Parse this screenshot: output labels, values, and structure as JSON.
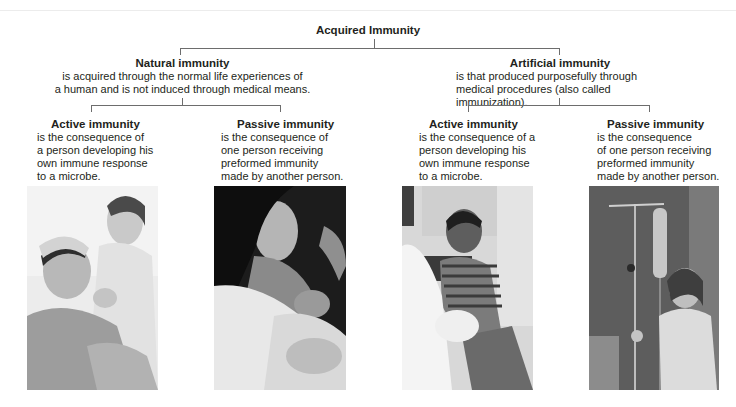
{
  "title": "Acquired Immunity",
  "branches": [
    {
      "heading": "Natural immunity",
      "description_lines": [
        "is acquired through the normal life experiences of",
        "a human and is not induced through medical means."
      ],
      "children": [
        {
          "heading": "Active immunity",
          "description_lines": [
            "is the consequence of",
            "a person developing his",
            "own immune response",
            "to a microbe."
          ],
          "photo": "child-with-fever-caregiver-photo"
        },
        {
          "heading": "Passive immunity",
          "description_lines": [
            "is the consequence of",
            "one person receiving",
            "preformed immunity",
            "made by another person."
          ],
          "photo": "mother-breastfeeding-infant-photo"
        }
      ]
    },
    {
      "heading": "Artificial immunity",
      "description_lines": [
        "is that produced purposefully through",
        "medical procedures (also called immunization)."
      ],
      "children": [
        {
          "heading": "Active immunity",
          "description_lines": [
            "is the consequence of a",
            "person developing his",
            "own immune response",
            "to a microbe."
          ],
          "photo": "child-receiving-vaccination-photo"
        },
        {
          "heading": "Passive immunity",
          "description_lines": [
            "is the consequence",
            "of one person receiving",
            "preformed immunity",
            "made by another person."
          ],
          "photo": "child-with-iv-drip-photo"
        }
      ]
    }
  ],
  "colors": {
    "text": "#231f20",
    "connector": "#6d6d6d",
    "background": "#ffffff"
  }
}
